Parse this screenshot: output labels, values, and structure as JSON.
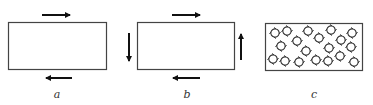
{
  "figure": {
    "panels": [
      {
        "label": "a",
        "description": "rectangle with shear arrows top (right) and bottom (left)"
      },
      {
        "label": "b",
        "description": "rectangle with arrows on all four sides: top right, bottom left, left down, right up"
      },
      {
        "label": "c",
        "description": "rectangle filled with small rotating vortex symbols"
      }
    ]
  },
  "colors": {
    "stroke": "#444444",
    "arrow": "#111111",
    "label": "#333333"
  }
}
